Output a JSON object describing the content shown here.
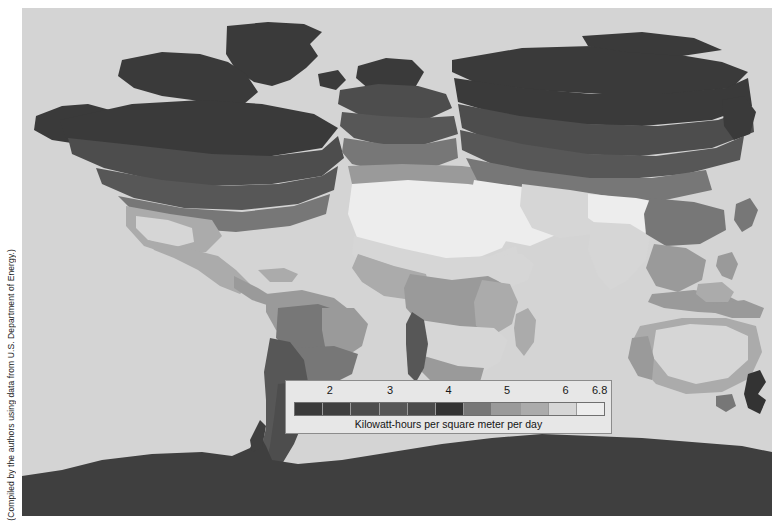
{
  "figure": {
    "credit": "(Compiled by the authors using data from U.S. Department of Energy.)",
    "background_color": "#ffffff",
    "ocean_color": "#d4d4d4"
  },
  "legend": {
    "caption": "Kilowatt-hours per square meter per day",
    "box_background": "#e7e7e7",
    "box_border": "#8c8c8c",
    "ticks": [
      {
        "label": "2",
        "pct": 13.5
      },
      {
        "label": "3",
        "pct": 32.0
      },
      {
        "label": "4",
        "pct": 50.0
      },
      {
        "label": "5",
        "pct": 68.0
      },
      {
        "label": "6",
        "pct": 86.0
      },
      {
        "label": "6.8",
        "pct": 96.5
      }
    ],
    "swatches": [
      {
        "color": "#3a3a3a",
        "value": "1.2"
      },
      {
        "color": "#3f3f3f",
        "value": "1.8"
      },
      {
        "color": "#4d4d4d",
        "value": "2.4"
      },
      {
        "color": "#575757",
        "value": "3.0"
      },
      {
        "color": "#4b4b4b",
        "value": "3.6"
      },
      {
        "color": "#333333",
        "value": "4.2"
      },
      {
        "color": "#777777",
        "value": "4.8"
      },
      {
        "color": "#9a9a9a",
        "value": "5.4"
      },
      {
        "color": "#ababab",
        "value": "5.8"
      },
      {
        "color": "#d6d6d6",
        "value": "6.3"
      },
      {
        "color": "#ededed",
        "value": "6.8"
      }
    ]
  },
  "chart_data": {
    "type": "heatmap",
    "xlabel": "",
    "ylabel": "",
    "legend_label": "Kilowatt-hours per square meter per day",
    "legend_position": "inset-bottom-center",
    "grid": false,
    "scale_min": 1.2,
    "scale_max": 6.8,
    "tick_labels": [
      "2",
      "3",
      "4",
      "5",
      "6",
      "6.8"
    ],
    "color_ramp": [
      "#3a3a3a",
      "#3f3f3f",
      "#4d4d4d",
      "#575757",
      "#4b4b4b",
      "#333333",
      "#777777",
      "#9a9a9a",
      "#ababab",
      "#d6d6d6",
      "#ededed"
    ],
    "regions": [
      {
        "name": "Arctic / Northern Canada / Greenland",
        "value": 2.0,
        "color": "#3a3a3a"
      },
      {
        "name": "Northern Siberia",
        "value": 2.0,
        "color": "#3a3a3a"
      },
      {
        "name": "Southern Canada",
        "value": 3.0,
        "color": "#4d4d4d"
      },
      {
        "name": "Northern United States",
        "value": 3.6,
        "color": "#4b4b4b"
      },
      {
        "name": "Southwestern United States",
        "value": 5.8,
        "color": "#ababab"
      },
      {
        "name": "Mexico",
        "value": 5.8,
        "color": "#ababab"
      },
      {
        "name": "Amazon Basin",
        "value": 4.8,
        "color": "#777777"
      },
      {
        "name": "Northeast Brazil",
        "value": 5.4,
        "color": "#9a9a9a"
      },
      {
        "name": "Atacama / Andes",
        "value": 6.3,
        "color": "#d6d6d6"
      },
      {
        "name": "Patagonia",
        "value": 3.0,
        "color": "#575757"
      },
      {
        "name": "Northern Europe",
        "value": 2.4,
        "color": "#4d4d4d"
      },
      {
        "name": "Mediterranean",
        "value": 4.8,
        "color": "#777777"
      },
      {
        "name": "Sahara Desert",
        "value": 6.8,
        "color": "#ededed"
      },
      {
        "name": "Arabian Peninsula",
        "value": 6.8,
        "color": "#ededed"
      },
      {
        "name": "Central Africa",
        "value": 5.4,
        "color": "#9a9a9a"
      },
      {
        "name": "Southern Africa",
        "value": 6.3,
        "color": "#d6d6d6"
      },
      {
        "name": "Central Asia",
        "value": 4.2,
        "color": "#777777"
      },
      {
        "name": "India",
        "value": 6.3,
        "color": "#d6d6d6"
      },
      {
        "name": "Southeast Asia",
        "value": 5.4,
        "color": "#9a9a9a"
      },
      {
        "name": "Australia interior",
        "value": 6.3,
        "color": "#d6d6d6"
      },
      {
        "name": "New Zealand",
        "value": 3.6,
        "color": "#4b4b4b"
      },
      {
        "name": "Antarctica",
        "value": 2.0,
        "color": "#3f3f3f"
      }
    ]
  }
}
